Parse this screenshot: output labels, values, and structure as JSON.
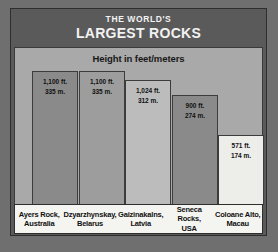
{
  "header": {
    "line1": "THE WORLD'S",
    "line2": "LARGEST ROCKS"
  },
  "chart_data": {
    "type": "bar",
    "title": "THE WORLD'S LARGEST ROCKS",
    "subtitle": "Height in feet/meters",
    "xlabel": "",
    "ylabel": "Height in feet/meters",
    "ylim": [
      0,
      1100
    ],
    "grid": false,
    "legend": "none",
    "unit_primary": "ft.",
    "unit_secondary": "m.",
    "categories": [
      "Ayers Rock, Australia",
      "Dzyarzhynskay, Belarus",
      "Gaizinakalns, Latvia",
      "Seneca Rocks, USA",
      "Coloane Alto, Macau"
    ],
    "values": [
      1100,
      1100,
      1024,
      900,
      571
    ],
    "values_meters": [
      335,
      335,
      312,
      274,
      174
    ],
    "bars": [
      {
        "name_line1": "Ayers Rock,",
        "name_line2": "Australia",
        "feet_label": "1,100 ft.",
        "meters_label": "335 m.",
        "feet": 1100,
        "meters": 335,
        "color": "#8a8a8a"
      },
      {
        "name_line1": "Dzyarzhynskay,",
        "name_line2": "Belarus",
        "feet_label": "1,100 ft.",
        "meters_label": "335 m.",
        "feet": 1100,
        "meters": 335,
        "color": "#9d9d9d"
      },
      {
        "name_line1": "Gaizinakalns,",
        "name_line2": "Latvia",
        "feet_label": "1,024 ft.",
        "meters_label": "312 m.",
        "feet": 1024,
        "meters": 312,
        "color": "#bcbcbc"
      },
      {
        "name_line1": "Seneca Rocks,",
        "name_line2": "USA",
        "feet_label": "900 ft.",
        "meters_label": "274 m.",
        "feet": 900,
        "meters": 274,
        "color": "#8a8a8a"
      },
      {
        "name_line1": "Coloane Alto,",
        "name_line2": "Macau",
        "feet_label": "571 ft.",
        "meters_label": "174 m.",
        "feet": 571,
        "meters": 174,
        "color": "#ededea"
      }
    ]
  }
}
